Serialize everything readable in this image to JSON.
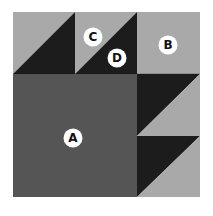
{
  "diagram": {
    "type": "quilt-block",
    "grid": "3x3",
    "colors": {
      "light": "#a9a9a9",
      "medium": "#555555",
      "dark": "#1c1c1c",
      "badge_bg": "#ffffff",
      "badge_text": "#111111"
    },
    "labels": {
      "A": "A",
      "B": "B",
      "C": "C",
      "D": "D"
    },
    "pieces": [
      {
        "id": "A",
        "shape": "large square",
        "color": "medium",
        "span": "rows 2-3, cols 1-2"
      },
      {
        "id": "B",
        "shape": "square",
        "color": "light",
        "position": "row 1, col 3"
      },
      {
        "id": "C",
        "shape": "half-square triangle",
        "color": "light",
        "position": "row 1, col 2, upper-left"
      },
      {
        "id": "D",
        "shape": "half-square triangle",
        "color": "dark",
        "position": "row 1, col 2, lower-right"
      }
    ]
  }
}
